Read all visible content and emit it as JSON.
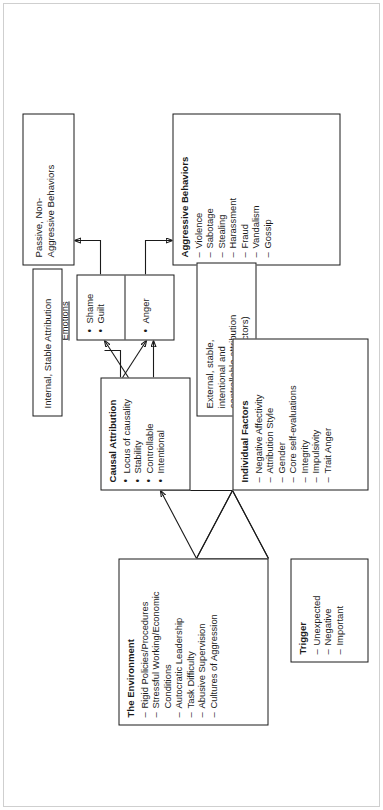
{
  "diagram": {
    "orientation": "rotated-90-ccw",
    "caption_emotions": "Emotions",
    "nodes": {
      "passive": {
        "name": "Passive, Non-Aggressive Behaviors",
        "line1": "Passive, Non-",
        "line2": "Aggressive Behaviors"
      },
      "aggressive": {
        "header": "Aggressive Behaviors",
        "items": [
          "Violence",
          "Sabotage",
          "Stealing",
          "Harassment",
          "Fraud",
          "Vandalism",
          "Gossip"
        ]
      },
      "emotions_left": {
        "items": [
          "Shame",
          "Guilt"
        ]
      },
      "emotions_right": {
        "items": [
          "Anger"
        ]
      },
      "internal_attr": {
        "text": "Internal, Stable Attribution"
      },
      "external_attr": {
        "line1": "External, stable,",
        "line2": "intentional and",
        "line3": "controllable attribution",
        "line4": "(no mitigating factors)"
      },
      "causal": {
        "header": "Causal Attribution",
        "items": [
          "Locus of causality",
          "Stability",
          "Controllable",
          "Intentional"
        ]
      },
      "environment": {
        "header": "The Environment",
        "items": [
          "Rigid Policies/Procedures",
          "Stressful Working/Economic",
          "Conditions",
          "Autocratic Leadership",
          "Task Difficulty",
          "Abusive Supervision",
          "Cultures of Aggression"
        ],
        "continuation_index": 2
      },
      "individual": {
        "header": "Individual Factors",
        "items": [
          "Negative Affectivity",
          "Attribution Style",
          "Gender",
          "Core self-evaluations",
          "Integrity",
          "Impulsivity",
          "Trait Anger"
        ]
      },
      "trigger": {
        "header": "Trigger",
        "items": [
          "Unexpected",
          "Negative",
          "Important"
        ]
      }
    },
    "colors": {
      "stroke": "#1a1a1a",
      "background": "#ffffff",
      "frame": "#cfcfcf"
    }
  }
}
